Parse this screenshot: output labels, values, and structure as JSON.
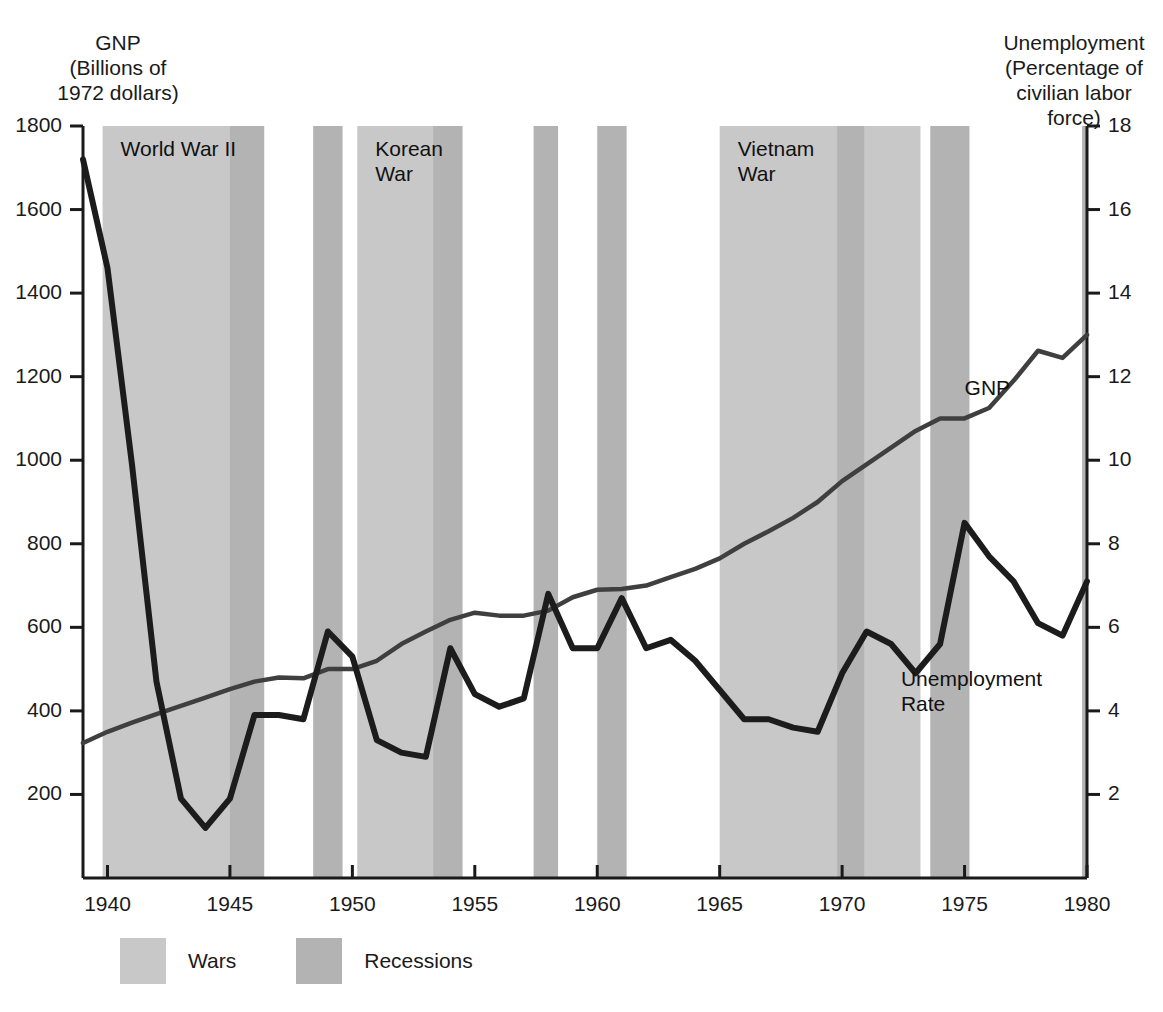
{
  "chart_data": {
    "type": "line",
    "title": "",
    "xlabel": "",
    "x_ticks": [
      1940,
      1945,
      1950,
      1955,
      1960,
      1965,
      1970,
      1975,
      1980
    ],
    "xlim": [
      1939,
      1980
    ],
    "grid": false,
    "legend_position": "bottom-left",
    "axes": {
      "left": {
        "label": "GNP\n(Billions of\n1972 dollars)",
        "ticks": [
          200,
          400,
          600,
          800,
          1000,
          1200,
          1400,
          1600,
          1800
        ],
        "lim": [
          0,
          1800
        ]
      },
      "right": {
        "label": "Unemployment\n(Percentage of\ncivilian labor\nforce)",
        "ticks": [
          2,
          4,
          6,
          8,
          10,
          12,
          14,
          16,
          18
        ],
        "lim": [
          0,
          18
        ]
      }
    },
    "series": [
      {
        "name": "GNP",
        "axis": "left",
        "units": "Billions of 1972 dollars",
        "x": [
          1939,
          1940,
          1941,
          1942,
          1943,
          1944,
          1945,
          1946,
          1947,
          1948,
          1949,
          1950,
          1951,
          1952,
          1953,
          1954,
          1955,
          1956,
          1957,
          1958,
          1959,
          1960,
          1961,
          1962,
          1963,
          1964,
          1965,
          1966,
          1967,
          1968,
          1969,
          1970,
          1971,
          1972,
          1973,
          1974,
          1975,
          1976,
          1977,
          1978,
          1979,
          1980
        ],
        "values": [
          323,
          350,
          372,
          392,
          412,
          432,
          452,
          470,
          480,
          478,
          500,
          500,
          520,
          560,
          590,
          618,
          635,
          628,
          628,
          640,
          672,
          690,
          692,
          700,
          720,
          740,
          765,
          800,
          830,
          862,
          900,
          950,
          990,
          1030,
          1070,
          1100,
          1100,
          1125,
          1190,
          1262,
          1245,
          1300
        ]
      },
      {
        "name": "Unemployment Rate",
        "axis": "right",
        "units": "Percent of civilian labor force",
        "x": [
          1939,
          1940,
          1941,
          1942,
          1943,
          1944,
          1945,
          1946,
          1947,
          1948,
          1949,
          1950,
          1951,
          1952,
          1953,
          1954,
          1955,
          1956,
          1957,
          1958,
          1959,
          1960,
          1961,
          1962,
          1963,
          1964,
          1965,
          1966,
          1967,
          1968,
          1969,
          1970,
          1971,
          1972,
          1973,
          1974,
          1975,
          1976,
          1977,
          1978,
          1979,
          1980
        ],
        "values": [
          17.2,
          14.6,
          9.9,
          4.7,
          1.9,
          1.2,
          1.9,
          3.9,
          3.9,
          3.8,
          5.9,
          5.3,
          3.3,
          3.0,
          2.9,
          5.5,
          4.4,
          4.1,
          4.3,
          6.8,
          5.5,
          5.5,
          6.7,
          5.5,
          5.7,
          5.2,
          4.5,
          3.8,
          3.8,
          3.6,
          3.5,
          4.9,
          5.9,
          5.6,
          4.9,
          5.6,
          8.5,
          7.7,
          7.1,
          6.1,
          5.8,
          7.1
        ]
      }
    ],
    "shaded_bands": [
      {
        "kind": "war",
        "label": "World War II",
        "start": 1939.8,
        "end": 1946.0
      },
      {
        "kind": "recession",
        "label": "",
        "start": 1945.0,
        "end": 1946.4
      },
      {
        "kind": "recession",
        "label": "",
        "start": 1948.4,
        "end": 1949.6
      },
      {
        "kind": "war",
        "label": "Korean\nWar",
        "start": 1950.2,
        "end": 1953.6
      },
      {
        "kind": "recession",
        "label": "",
        "start": 1953.3,
        "end": 1954.5
      },
      {
        "kind": "recession",
        "label": "",
        "start": 1957.4,
        "end": 1958.4
      },
      {
        "kind": "recession",
        "label": "",
        "start": 1960.0,
        "end": 1961.2
      },
      {
        "kind": "war",
        "label": "Vietnam\nWar",
        "start": 1965.0,
        "end": 1973.2
      },
      {
        "kind": "recession",
        "label": "",
        "start": 1969.8,
        "end": 1970.9
      },
      {
        "kind": "recession",
        "label": "",
        "start": 1973.6,
        "end": 1975.2
      },
      {
        "kind": "recession",
        "label": "",
        "start": 1979.8,
        "end": 1980.4
      }
    ],
    "series_annotations": [
      {
        "name": "gnp-series-label",
        "text": "GNP",
        "x": 1975.0,
        "y_left": 1170
      },
      {
        "name": "unemployment-series-label",
        "text": "Unemployment\nRate",
        "x": 1972.4,
        "y_right": 4.75
      }
    ],
    "legend": {
      "items": [
        {
          "label": "Wars",
          "color": "#c8c8c8"
        },
        {
          "label": "Recessions",
          "color": "#b3b3b3"
        }
      ]
    },
    "colors": {
      "war_band": "#c8c8c8",
      "recession_band": "#b3b3b3",
      "gnp_line": "#3f3f3f",
      "unemployment_line": "#1c1c1c",
      "axis": "#1a1a1a",
      "background": "#ffffff"
    }
  },
  "axis_captions": {
    "left": "GNP\n(Billions of\n1972 dollars)",
    "right": "Unemployment\n(Percentage of\ncivilian labor\nforce)"
  }
}
